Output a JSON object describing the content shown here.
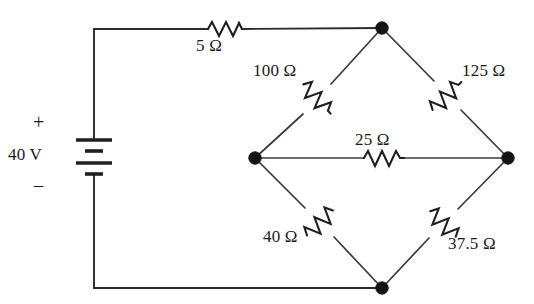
{
  "diagram": {
    "type": "electrical-circuit-schematic",
    "background_color": "#ffffff",
    "line_color": "#2b2b2b"
  },
  "source": {
    "kind": "battery-dc-voltage-source",
    "value_label": "40 V",
    "plus_label": "+",
    "minus_label": "−",
    "polarity_top": "+",
    "polarity_bottom": "−"
  },
  "components": [
    {
      "id": "r5",
      "name": "resistor-5-ohm",
      "label": "5 Ω",
      "value": 5,
      "unit": "Ω",
      "orientation": "horizontal"
    },
    {
      "id": "r100",
      "name": "resistor-100-ohm",
      "label": "100 Ω",
      "value": 100,
      "unit": "Ω",
      "orientation": "diagonal-down-left"
    },
    {
      "id": "r125",
      "name": "resistor-125-ohm",
      "label": "125 Ω",
      "value": 125,
      "unit": "Ω",
      "orientation": "diagonal-down-right"
    },
    {
      "id": "r25",
      "name": "resistor-25-ohm",
      "label": "25 Ω",
      "value": 25,
      "unit": "Ω",
      "orientation": "horizontal"
    },
    {
      "id": "r40",
      "name": "resistor-40-ohm",
      "label": "40 Ω",
      "value": 40,
      "unit": "Ω",
      "orientation": "diagonal-down-right"
    },
    {
      "id": "r375",
      "name": "resistor-37.5-ohm",
      "label": "37.5 Ω",
      "value": 37.5,
      "unit": "Ω",
      "orientation": "diagonal-down-left"
    }
  ],
  "nodes": [
    {
      "id": "top",
      "name": "node-top",
      "x": 382,
      "y": 28
    },
    {
      "id": "left",
      "name": "node-left",
      "x": 255,
      "y": 158
    },
    {
      "id": "right",
      "name": "node-right",
      "x": 508,
      "y": 158
    },
    {
      "id": "bottom",
      "name": "node-bottom",
      "x": 382,
      "y": 288
    }
  ]
}
